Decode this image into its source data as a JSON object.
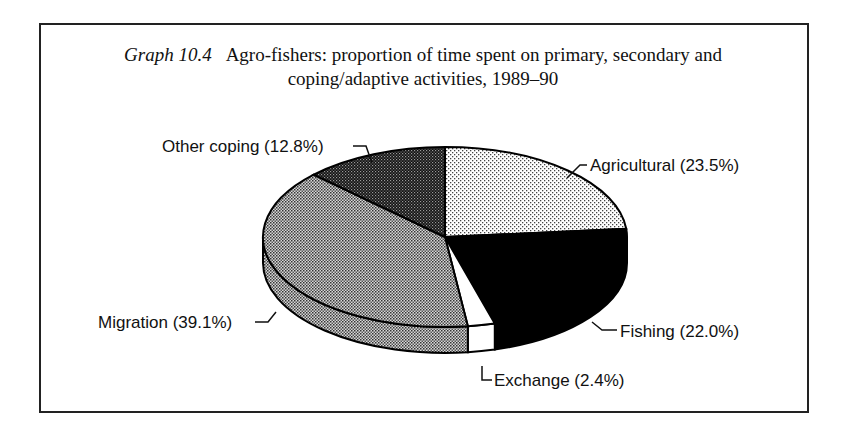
{
  "figure": {
    "label": "Graph 10.4",
    "title_line1": "Agro-fishers: proportion of time spent on primary, secondary and",
    "title_line2": "coping/adaptive activities, 1989–90"
  },
  "chart_data": {
    "type": "pie",
    "style": "3d",
    "title": "Agro-fishers: proportion of time spent on primary, secondary and coping/adaptive activities, 1989–90",
    "figure_label": "Graph 10.4",
    "slices": [
      {
        "name": "Agricultural",
        "value": 23.5,
        "label": "Agricultural (23.5%)",
        "fill": "light-dotted"
      },
      {
        "name": "Fishing",
        "value": 22.0,
        "label": "Fishing (22.0%)",
        "fill": "black"
      },
      {
        "name": "Exchange",
        "value": 2.4,
        "label": "Exchange (2.4%)",
        "fill": "white"
      },
      {
        "name": "Migration",
        "value": 39.1,
        "label": "Migration (39.1%)",
        "fill": "medium-dotted"
      },
      {
        "name": "Other coping",
        "value": 12.8,
        "label": "Other coping (12.8%)",
        "fill": "dark-dotted"
      }
    ],
    "start_angle": "12 o'clock",
    "direction": "clockwise",
    "legend": "none (callout labels)"
  }
}
